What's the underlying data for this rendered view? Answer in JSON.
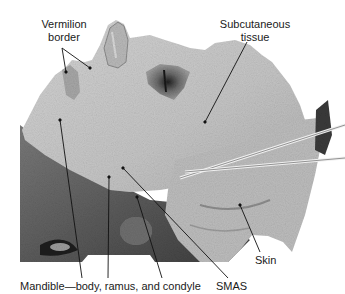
{
  "figure": {
    "labels": [
      {
        "id": "vermilion",
        "text_line1": "Vermilion",
        "text_line2": "border"
      },
      {
        "id": "subcutaneous",
        "text_line1": "Subcutaneous",
        "text_line2": "tissue"
      },
      {
        "id": "skin",
        "text": "Skin"
      },
      {
        "id": "mandible",
        "text": "Mandible—body, ramus, and condyle"
      },
      {
        "id": "smas",
        "text": "SMAS"
      }
    ],
    "colors": {
      "background": "#ffffff",
      "tissue_light": "#c8c8c8",
      "tissue_mid": "#a8a8a8",
      "tissue_dark": "#5a5a5a",
      "leader_line": "#111111",
      "instrument": "#e8e8e8"
    }
  }
}
